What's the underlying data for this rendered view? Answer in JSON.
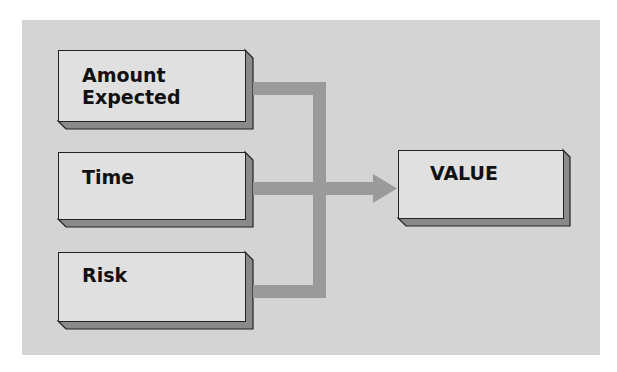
{
  "diagram": {
    "inputs": [
      {
        "label_line1": "Amount",
        "label_line2": "Expected"
      },
      {
        "label_line1": "Time"
      },
      {
        "label_line1": "Risk"
      }
    ],
    "output": {
      "label": "VALUE"
    },
    "colors": {
      "panel": "#d4d4d4",
      "box_face": "#e0e0e0",
      "box_side": "#8a8a8a",
      "connector": "#9a9a9a",
      "text": "#111111"
    }
  }
}
